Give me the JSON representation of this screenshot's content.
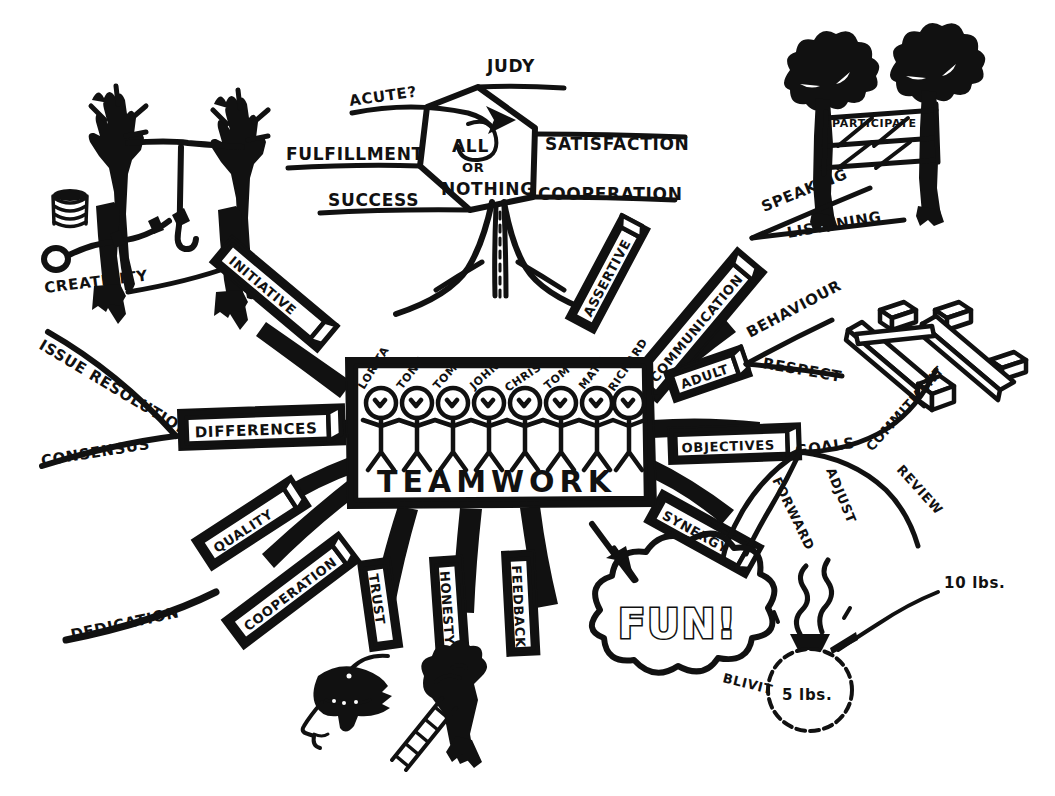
{
  "meta": {
    "ink_color": "#111111",
    "paper_color": "#ffffff"
  },
  "center": {
    "title": "TEAMWORK",
    "people": [
      "LORITA",
      "TONY",
      "TOM",
      "JOHN",
      "CHRIS",
      "TOM",
      "MATT",
      "RICHARD"
    ]
  },
  "hexagon": {
    "line1": "ALL",
    "line2": "OR",
    "line3": "NOTHING",
    "spokes": [
      {
        "label": "ACUTE?",
        "dir": "upper-left"
      },
      {
        "label": "JUDY",
        "dir": "top"
      },
      {
        "label": "FULFILLMENT",
        "dir": "left"
      },
      {
        "label": "SATISFACTION",
        "dir": "right"
      },
      {
        "label": "SUCCESS",
        "dir": "lower-left"
      },
      {
        "label": "COOPERATION",
        "dir": "lower-right"
      }
    ]
  },
  "boxes": [
    {
      "label": "INITIATIVE"
    },
    {
      "label": "DIFFERENCES"
    },
    {
      "label": "QUALITY"
    },
    {
      "label": "COOPERATION"
    },
    {
      "label": "TRUST"
    },
    {
      "label": "HONESTY"
    },
    {
      "label": "FEEDBACK"
    },
    {
      "label": "SYNERGY"
    },
    {
      "label": "OBJECTIVES"
    },
    {
      "label": "ADULT"
    },
    {
      "label": "COMMUNICATION"
    },
    {
      "label": "ASSERTIVE"
    }
  ],
  "branches": [
    {
      "label": "CREATIVITY",
      "parent": "INITIATIVE"
    },
    {
      "label": "ISSUE RESOLUTION",
      "parent": "DIFFERENCES"
    },
    {
      "label": "CONSENSUS",
      "parent": "DIFFERENCES"
    },
    {
      "label": "DEDICATION",
      "parent": "COOPERATION"
    },
    {
      "label": "SPEAKING",
      "parent": "COMMUNICATION"
    },
    {
      "label": "LISTENING",
      "parent": "COMMUNICATION"
    },
    {
      "label": "BEHAVIOUR",
      "parent": "ADULT"
    },
    {
      "label": "RESPECT",
      "parent": "ADULT"
    },
    {
      "label": "GOALS",
      "parent": "OBJECTIVES"
    },
    {
      "label": "COMMITMENT",
      "parent": "OBJECTIVES"
    },
    {
      "label": "REVIEW",
      "parent": "OBJECTIVES"
    },
    {
      "label": "FORWARD",
      "parent": "OBJECTIVES"
    },
    {
      "label": "ADJUST",
      "parent": "OBJECTIVES"
    }
  ],
  "cloud": {
    "label": "FUN!",
    "tag": "BLIVIT"
  },
  "weights": {
    "bag_label": "5 lbs.",
    "arrow_label": "10 lbs."
  },
  "gate": {
    "sign": "PARTICIPATE"
  },
  "icons": {
    "rope_swing": "rope-swing-trees-icon",
    "rope_coil": "rope-coil-icon",
    "rope_loop": "rope-loop-icon",
    "gate_trees": "gate-trees-icon",
    "planks_blocks": "planks-blocks-icon",
    "blindfold_head": "blindfolded-head-icon",
    "ladder_person": "person-with-ladder-icon",
    "weight_bag": "weight-bag-icon",
    "fun_arrow": "arrow-to-fun-icon"
  }
}
